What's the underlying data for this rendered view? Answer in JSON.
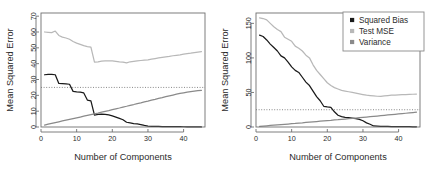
{
  "figure": {
    "background_color": "#ffffff",
    "panels": [
      {
        "id": "left",
        "name": "pcr-bias-variance-left",
        "show_legend": false
      },
      {
        "id": "right",
        "name": "pcr-bias-variance-right",
        "show_legend": true
      }
    ],
    "legend": {
      "position": "top-right",
      "entries": [
        {
          "label": "Squared Bias",
          "color": "#1a1a1a",
          "marker": "square-marker"
        },
        {
          "label": "Test MSE",
          "color": "#b8b8b8",
          "marker": "square-marker"
        },
        {
          "label": "Variance",
          "color": "#8a8a8a",
          "marker": "square-marker"
        }
      ]
    }
  },
  "chart_data": [
    {
      "type": "line",
      "title": "",
      "xlabel": "Number of Components",
      "ylabel": "Mean Squared Error",
      "xlim": [
        0,
        46
      ],
      "ylim": [
        0,
        72
      ],
      "xticks": [
        0,
        10,
        20,
        30,
        40
      ],
      "yticks": [
        0,
        10,
        20,
        30,
        40,
        50,
        60,
        70
      ],
      "grid": false,
      "legend": "none",
      "annotations": [
        {
          "type": "hline",
          "value": 25,
          "style": "dotted",
          "color": "#7a7a7a"
        }
      ],
      "x": [
        1,
        2,
        3,
        4,
        5,
        6,
        7,
        8,
        9,
        10,
        11,
        12,
        13,
        14,
        15,
        16,
        17,
        18,
        19,
        20,
        21,
        22,
        23,
        24,
        25,
        26,
        27,
        28,
        29,
        30,
        31,
        32,
        33,
        34,
        35,
        36,
        37,
        38,
        39,
        40,
        41,
        42,
        43,
        44,
        45
      ],
      "series": [
        {
          "name": "Test MSE",
          "color": "#b8b8b8",
          "values": [
            60.0,
            59.8,
            59.6,
            60.6,
            57.8,
            56.8,
            56.2,
            55.4,
            54.0,
            53.0,
            52.2,
            51.4,
            50.8,
            50.4,
            41.0,
            41.2,
            41.6,
            41.8,
            41.8,
            41.8,
            41.5,
            41.2,
            41.0,
            40.5,
            41.2,
            41.5,
            41.8,
            42.0,
            42.2,
            42.4,
            42.8,
            43.2,
            43.6,
            44.0,
            44.3,
            44.6,
            45.0,
            45.3,
            45.6,
            46.0,
            46.3,
            46.6,
            47.0,
            47.3,
            47.6
          ]
        },
        {
          "name": "Squared Bias",
          "color": "#1a1a1a",
          "values": [
            33.0,
            33.2,
            33.2,
            33.0,
            27.5,
            27.4,
            27.2,
            27.0,
            22.5,
            22.2,
            22.0,
            21.5,
            17.0,
            16.5,
            7.5,
            8.0,
            8.1,
            8.0,
            7.6,
            7.0,
            6.2,
            5.4,
            4.6,
            3.0,
            2.6,
            2.2,
            1.9,
            1.5,
            1.0,
            0.6,
            0.45,
            0.4,
            0.35,
            0.3,
            0.28,
            0.25,
            0.22,
            0.2,
            0.18,
            0.16,
            0.14,
            0.12,
            0.1,
            0.08,
            0.05
          ]
        },
        {
          "name": "Variance",
          "color": "#8a8a8a",
          "values": [
            1.2,
            1.8,
            2.3,
            2.8,
            3.3,
            3.8,
            4.3,
            4.8,
            5.3,
            5.8,
            6.3,
            6.8,
            7.3,
            7.8,
            8.3,
            8.8,
            9.4,
            9.9,
            10.4,
            11.0,
            11.5,
            12.0,
            12.6,
            13.1,
            13.7,
            14.2,
            14.8,
            15.3,
            15.9,
            16.4,
            17.0,
            17.5,
            18.1,
            18.6,
            19.2,
            19.7,
            20.2,
            20.7,
            21.2,
            21.6,
            22.0,
            22.3,
            22.6,
            22.9,
            23.2
          ]
        }
      ]
    },
    {
      "type": "line",
      "title": "",
      "xlabel": "Number of Components",
      "ylabel": "Mean Squared Error",
      "xlim": [
        0,
        46
      ],
      "ylim": [
        0,
        165
      ],
      "xticks": [
        0,
        10,
        20,
        30,
        40
      ],
      "yticks": [
        0,
        50,
        100,
        150
      ],
      "grid": false,
      "legend": "top-right",
      "annotations": [
        {
          "type": "hline",
          "value": 25,
          "style": "dotted",
          "color": "#7a7a7a"
        }
      ],
      "x": [
        1,
        2,
        3,
        4,
        5,
        6,
        7,
        8,
        9,
        10,
        11,
        12,
        13,
        14,
        15,
        16,
        17,
        18,
        19,
        20,
        21,
        22,
        23,
        24,
        25,
        26,
        27,
        28,
        29,
        30,
        31,
        32,
        33,
        34,
        35,
        36,
        37,
        38,
        39,
        40,
        41,
        42,
        43,
        44,
        45
      ],
      "series": [
        {
          "name": "Test MSE",
          "color": "#b8b8b8",
          "values": [
            158,
            157,
            155,
            150,
            145,
            141,
            138,
            130,
            127,
            124,
            117,
            114,
            110,
            104,
            100,
            90,
            82,
            76,
            70,
            64,
            60,
            57,
            55,
            53,
            52,
            51,
            50,
            49,
            48,
            47,
            46,
            45.5,
            45,
            44.5,
            44.2,
            45,
            45.5,
            46,
            46.2,
            46.5,
            46.8,
            47,
            47.2,
            47.4,
            47.6
          ]
        },
        {
          "name": "Squared Bias",
          "color": "#1a1a1a",
          "values": [
            133,
            131,
            126,
            120,
            115,
            110,
            103,
            100,
            94,
            87,
            82,
            79,
            72,
            65,
            60,
            52,
            44,
            38,
            30,
            29,
            28.5,
            22,
            17,
            15,
            14,
            13.5,
            13,
            12,
            11,
            9,
            6,
            4,
            1.5,
            1.2,
            1.0,
            0.9,
            0.8,
            0.7,
            0.6,
            0.55,
            0.5,
            0.45,
            0.4,
            0.35,
            0.3
          ]
        },
        {
          "name": "Variance",
          "color": "#8a8a8a",
          "values": [
            1.0,
            1.4,
            1.8,
            2.2,
            2.6,
            3.0,
            3.5,
            3.9,
            4.3,
            4.8,
            5.2,
            5.7,
            6.1,
            6.6,
            7.0,
            7.5,
            7.9,
            8.4,
            8.8,
            9.3,
            9.7,
            10.2,
            10.6,
            11.1,
            11.5,
            12.0,
            12.4,
            12.9,
            13.4,
            13.9,
            14.4,
            14.9,
            15.4,
            15.9,
            16.4,
            16.9,
            17.4,
            17.9,
            18.4,
            18.9,
            19.4,
            19.9,
            20.4,
            20.9,
            21.4
          ]
        }
      ]
    }
  ]
}
